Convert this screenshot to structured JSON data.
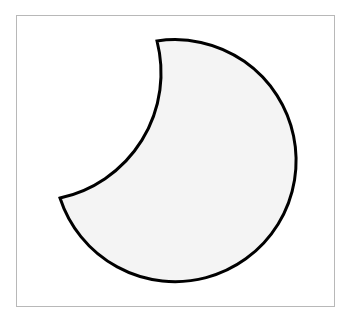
{
  "figure": {
    "shape": "crescent",
    "fill_color": "#f4f4f4",
    "stroke_color": "#000000",
    "frame_color": "#b8b8b8"
  }
}
